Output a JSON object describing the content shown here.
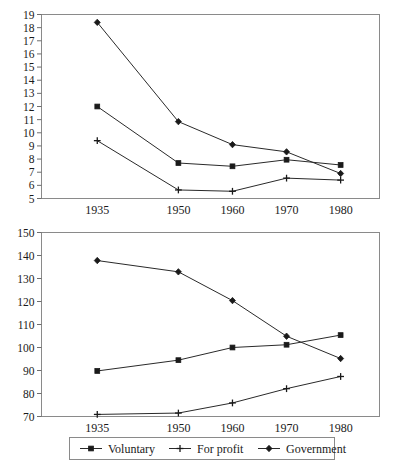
{
  "chart_data": [
    {
      "type": "line",
      "title": "",
      "subtitle": "",
      "xlabel": "",
      "ylabel": "",
      "panel": "top",
      "categories": [
        "1935",
        "1950",
        "1960",
        "1970",
        "1980"
      ],
      "x": [
        1935,
        1950,
        1960,
        1970,
        1980
      ],
      "xlim": [
        1930,
        1985
      ],
      "ylim": [
        5,
        19
      ],
      "yticks": [
        5,
        6,
        7,
        8,
        9,
        10,
        11,
        12,
        13,
        14,
        15,
        16,
        17,
        18,
        19
      ],
      "xticks": [
        "1935",
        "1950",
        "1960",
        "1970",
        "1980"
      ],
      "grid": false,
      "legend_position": "below-bottom-panel",
      "series": [
        {
          "name": "Voluntary",
          "marker": "square",
          "values": [
            12.0,
            7.7,
            7.45,
            7.95,
            7.55
          ]
        },
        {
          "name": "For profit",
          "marker": "plus",
          "values": [
            9.4,
            5.65,
            5.55,
            6.55,
            6.4
          ]
        },
        {
          "name": "Government",
          "marker": "diamond",
          "values": [
            18.4,
            10.85,
            9.1,
            8.55,
            6.9
          ]
        }
      ]
    },
    {
      "type": "line",
      "title": "",
      "subtitle": "",
      "xlabel": "",
      "ylabel": "",
      "panel": "bottom",
      "categories": [
        "1935",
        "1950",
        "1960",
        "1970",
        "1980"
      ],
      "x": [
        1935,
        1950,
        1960,
        1970,
        1980
      ],
      "xlim": [
        1930,
        1985
      ],
      "ylim": [
        70,
        150
      ],
      "yticks": [
        70,
        80,
        90,
        100,
        110,
        120,
        130,
        140,
        150
      ],
      "xticks": [
        "1935",
        "1950",
        "1960",
        "1970",
        "1980"
      ],
      "grid": false,
      "legend_position": "below",
      "series": [
        {
          "name": "Voluntary",
          "marker": "square",
          "values": [
            89.8,
            94.5,
            100.0,
            101.2,
            105.4
          ]
        },
        {
          "name": "For profit",
          "marker": "plus",
          "values": [
            70.9,
            71.5,
            75.9,
            82.1,
            87.4
          ]
        },
        {
          "name": "Government",
          "marker": "diamond",
          "values": [
            137.8,
            132.9,
            120.4,
            104.9,
            95.2
          ]
        }
      ]
    }
  ],
  "legend": {
    "items": [
      {
        "label": "Voluntary",
        "marker": "square"
      },
      {
        "label": "For profit",
        "marker": "plus"
      },
      {
        "label": "Government",
        "marker": "diamond"
      }
    ]
  },
  "colors": {
    "line": "#2a2a2a",
    "marker": "#1a1a1a",
    "frame": "#8a8a8a",
    "text": "#1a1a1a",
    "background": "#ffffff"
  },
  "top_panel_labels": {
    "y": [
      "19",
      "18",
      "17",
      "16",
      "15",
      "14",
      "13",
      "12",
      "11",
      "10",
      "9",
      "8",
      "7",
      "6",
      "5"
    ],
    "x": [
      "1935",
      "1950",
      "1960",
      "1970",
      "1980"
    ]
  },
  "bottom_panel_labels": {
    "y": [
      "150",
      "140",
      "130",
      "120",
      "110",
      "100",
      "90",
      "80",
      "70"
    ],
    "x": [
      "1935",
      "1950",
      "1960",
      "1970",
      "1980"
    ]
  }
}
